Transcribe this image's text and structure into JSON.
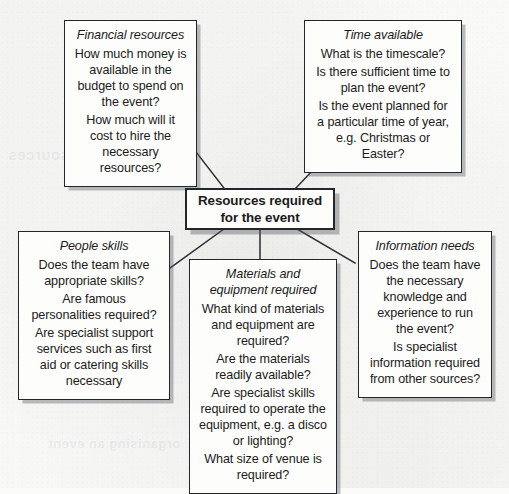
{
  "diagram": {
    "type": "spider-mind-map",
    "center": {
      "name": "center-node",
      "lines": [
        "Resources required",
        "for the event"
      ],
      "text": "Resources required for the event"
    },
    "nodes": [
      {
        "id": "financial-resources",
        "heading": "Financial resources",
        "items": [
          "How much money is available in the budget to spend on the event?",
          "How much will it cost to hire the necessary resources?"
        ]
      },
      {
        "id": "time-available",
        "heading": "Time available",
        "items": [
          "What is the timescale?",
          "Is there sufficient time to plan the event?",
          "Is the event planned for a particular time of year, e.g. Christmas or Easter?"
        ]
      },
      {
        "id": "people-skills",
        "heading": "People skills",
        "items": [
          "Does the team have appropriate skills?",
          "Are famous personalities required?",
          "Are specialist support services such as first aid or catering skills necessary"
        ]
      },
      {
        "id": "materials-and-equipment-required",
        "heading": "Materials and equipment required",
        "items": [
          "What kind of materials and equipment are required?",
          "Are the materials readily available?",
          "Are specialist skills required to operate the equipment, e.g. a disco or lighting?",
          "What size of venue is required?"
        ]
      },
      {
        "id": "information-needs",
        "heading": "Information needs",
        "items": [
          "Does the team have the necessary knowledge and experience to run the event?",
          "Is specialist information required from other sources?"
        ]
      }
    ],
    "colors": {
      "page_background": "#f9f9f8",
      "box_fill": "#fdfdfc",
      "box_border": "#23262b",
      "box_shadow": "#5a5c60",
      "connector_line": "#2a2d32",
      "text": "#1b1b1b"
    },
    "background_bleed": {
      "top_left": "Resources",
      "bottom_left": "organising an event"
    }
  }
}
